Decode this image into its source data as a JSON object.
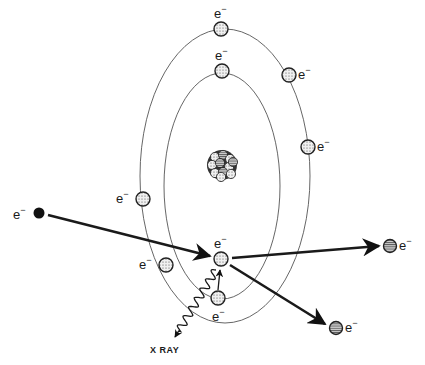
{
  "diagram": {
    "title": "",
    "electron_symbol": "e",
    "electron_charge": "−",
    "xray_label": "X RAY",
    "colors": {
      "background": "#ffffff",
      "line": "#1a1a1a",
      "orbit": "#555555",
      "electron_fill": "#e8e8e8",
      "incident_electron_fill": "#111111",
      "scattered_electron_fill": "#9a9a9a"
    },
    "nucleus": {
      "label": "nucleus",
      "x": 222,
      "y": 165
    },
    "orbits": [
      {
        "name": "outer-shell",
        "cx": 225,
        "cy": 176,
        "rx": 85,
        "ry": 147
      },
      {
        "name": "inner-shell",
        "cx": 222,
        "cy": 186,
        "rx": 58,
        "ry": 113
      }
    ],
    "electrons": [
      {
        "name": "outer-top",
        "x": 221,
        "y": 29,
        "label": "e−",
        "label_pos": "above"
      },
      {
        "name": "outer-upper-right",
        "x": 289,
        "y": 75,
        "label": "e−",
        "label_pos": "right"
      },
      {
        "name": "outer-right",
        "x": 308,
        "y": 147,
        "label": "e−",
        "label_pos": "right"
      },
      {
        "name": "outer-left",
        "x": 143,
        "y": 199,
        "label": "e−",
        "label_pos": "left"
      },
      {
        "name": "outer-lower-left",
        "x": 166,
        "y": 265,
        "label": "e−",
        "label_pos": "left"
      },
      {
        "name": "inner-top",
        "x": 222,
        "y": 71,
        "label": "e−",
        "label_pos": "above"
      },
      {
        "name": "inner-struck",
        "x": 221,
        "y": 259,
        "label": "e−",
        "label_pos": "above"
      },
      {
        "name": "inner-bottom",
        "x": 218,
        "y": 298,
        "label": "e−",
        "label_pos": "below"
      }
    ],
    "incident_electron": {
      "x": 39,
      "y": 213,
      "label": "e−"
    },
    "scattered_electrons": [
      {
        "name": "scattered-primary",
        "x": 390,
        "y": 246,
        "label": "e−"
      },
      {
        "name": "ejected-electron",
        "x": 336,
        "y": 328,
        "label": "e−"
      }
    ],
    "arrows": [
      {
        "name": "incident-path",
        "from": [
          48,
          215
        ],
        "to": [
          210,
          256
        ]
      },
      {
        "name": "scattered-path",
        "from": [
          232,
          258
        ],
        "to": [
          379,
          246
        ]
      },
      {
        "name": "ejected-path",
        "from": [
          230,
          265
        ],
        "to": [
          325,
          324
        ]
      },
      {
        "name": "transition-arrow",
        "from": [
          218,
          290
        ],
        "to": [
          220,
          270
        ]
      }
    ],
    "xray": {
      "from": [
        216,
        270
      ],
      "to": [
        175,
        337
      ],
      "label": "X RAY",
      "label_x": 150,
      "label_y": 346
    }
  }
}
